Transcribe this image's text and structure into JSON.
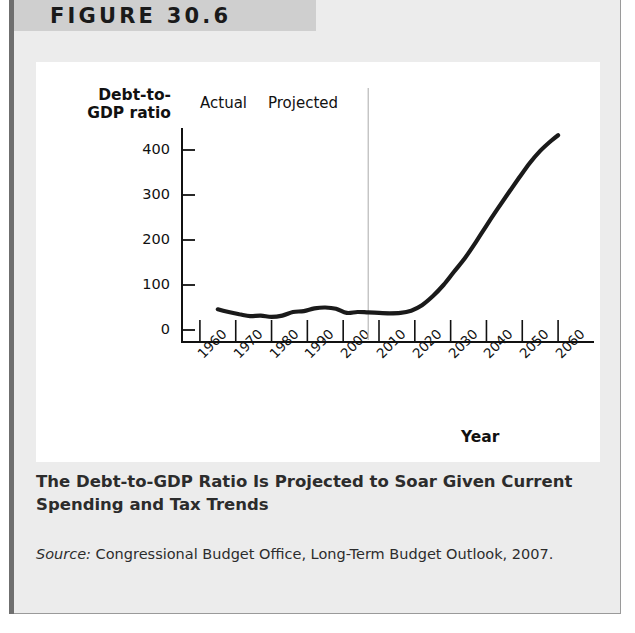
{
  "figure": {
    "header_label": "FIGURE 30.6",
    "caption": "The Debt-to-GDP Ratio Is Projected to Soar Given Current Spending and Tax Trends",
    "source_prefix": "Source:",
    "source_text": " Congressional Budget Office, Long-Term Budget Outlook, 2007."
  },
  "chart_data": {
    "type": "line",
    "title": "",
    "xlabel": "Year",
    "ylabel": "Debt-to-GDP ratio",
    "ylabel_line1": "Debt-to-",
    "ylabel_line2": "GDP ratio",
    "xlim": [
      1955,
      2065
    ],
    "ylim": [
      0,
      440
    ],
    "yticks": [
      0,
      100,
      200,
      300,
      400
    ],
    "xticks": [
      1960,
      1970,
      1980,
      1990,
      2000,
      2010,
      2020,
      2030,
      2040,
      2050,
      2060
    ],
    "grid": false,
    "legend": "none",
    "annotations": [
      {
        "name": "actual",
        "text": "Actual",
        "x": 1995
      },
      {
        "name": "projected",
        "text": "Projected",
        "x": 2013
      }
    ],
    "divider_year": 2007,
    "series": [
      {
        "name": "Debt-to-GDP ratio",
        "color": "#1a1a1a",
        "x": [
          1965,
          1968,
          1971,
          1974,
          1977,
          1980,
          1983,
          1986,
          1989,
          1992,
          1995,
          1998,
          2001,
          2004,
          2007,
          2010,
          2013,
          2016,
          2019,
          2022,
          2025,
          2028,
          2031,
          2034,
          2037,
          2040,
          2043,
          2046,
          2049,
          2052,
          2055,
          2058,
          2060
        ],
        "values": [
          46,
          40,
          35,
          31,
          32,
          29,
          32,
          40,
          42,
          48,
          50,
          47,
          38,
          40,
          39,
          38,
          37,
          38,
          43,
          55,
          75,
          100,
          130,
          160,
          195,
          232,
          268,
          303,
          337,
          370,
          398,
          420,
          433
        ]
      }
    ]
  }
}
